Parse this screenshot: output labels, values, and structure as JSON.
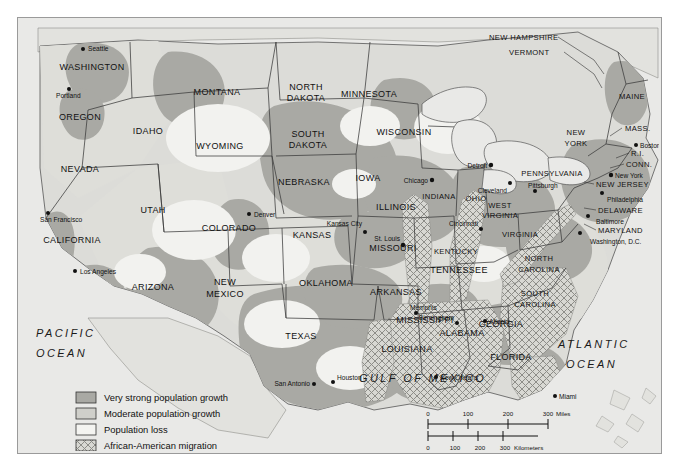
{
  "map": {
    "title": "United States population change and African-American migration",
    "background_color": "#e9e9e7",
    "land_color": "#dcdcd8",
    "frame_color": "#9a9a9a"
  },
  "oceans": [
    {
      "name": "pacific-ocean",
      "line1": "PACIFIC",
      "line2": "OCEAN"
    },
    {
      "name": "atlantic-ocean",
      "line1": "ATLANTIC",
      "line2": "OCEAN"
    },
    {
      "name": "gulf-of-mexico",
      "line1": "GULF OF MEXICO",
      "line2": ""
    }
  ],
  "states": [
    {
      "label": "WASHINGTON",
      "x": 91,
      "y": 69
    },
    {
      "label": "OREGON",
      "x": 79,
      "y": 119
    },
    {
      "label": "IDAHO",
      "x": 147,
      "y": 133
    },
    {
      "label": "MONTANA",
      "x": 216,
      "y": 94
    },
    {
      "label": "NORTH\nDAKOTA",
      "x": 305,
      "y": 93
    },
    {
      "label": "MINNESOTA",
      "x": 368,
      "y": 96
    },
    {
      "label": "WISCONSIN",
      "x": 403,
      "y": 134
    },
    {
      "label": "SOUTH\nDAKOTA",
      "x": 307,
      "y": 140
    },
    {
      "label": "WYOMING",
      "x": 219,
      "y": 148
    },
    {
      "label": "NEVADA",
      "x": 79,
      "y": 171
    },
    {
      "label": "NEBRASKA",
      "x": 303,
      "y": 184
    },
    {
      "label": "IOWA",
      "x": 367,
      "y": 180
    },
    {
      "label": "UTAH",
      "x": 152,
      "y": 212
    },
    {
      "label": "COLORADO",
      "x": 228,
      "y": 230
    },
    {
      "label": "KANSAS",
      "x": 311,
      "y": 237
    },
    {
      "label": "ILLINOIS",
      "x": 395,
      "y": 209
    },
    {
      "label": "INDIANA",
      "x": 438,
      "y": 198
    },
    {
      "label": "OHIO",
      "x": 475,
      "y": 200
    },
    {
      "label": "CALIFORNIA",
      "x": 71,
      "y": 242
    },
    {
      "label": "ARIZONA",
      "x": 152,
      "y": 289
    },
    {
      "label": "NEW\nMEXICO",
      "x": 224,
      "y": 290
    },
    {
      "label": "OKLAHOMA",
      "x": 325,
      "y": 285
    },
    {
      "label": "MISSOURI",
      "x": 392,
      "y": 250
    },
    {
      "label": "KENTUCKY",
      "x": 455,
      "y": 253
    },
    {
      "label": "WEST\nVIRGINIA",
      "x": 499,
      "y": 211
    },
    {
      "label": "VIRGINIA",
      "x": 519,
      "y": 236
    },
    {
      "label": "TENNESSEE",
      "x": 458,
      "y": 272
    },
    {
      "label": "NORTH\nCAROLINA",
      "x": 538,
      "y": 264
    },
    {
      "label": "SOUTH\nCAROLINA",
      "x": 534,
      "y": 299
    },
    {
      "label": "ARKANSAS",
      "x": 395,
      "y": 294
    },
    {
      "label": "MISSISSIPPI",
      "x": 424,
      "y": 322
    },
    {
      "label": "ALABAMA",
      "x": 461,
      "y": 335
    },
    {
      "label": "GEORGIA",
      "x": 500,
      "y": 326
    },
    {
      "label": "FLORIDA",
      "x": 510,
      "y": 359
    },
    {
      "label": "LOUISIANA",
      "x": 406,
      "y": 351
    },
    {
      "label": "TEXAS",
      "x": 300,
      "y": 338
    },
    {
      "label": "MAINE",
      "x": 631,
      "y": 98
    },
    {
      "label": "NEW\nYORK",
      "x": 575,
      "y": 139
    },
    {
      "label": "PENNSYLVANIA",
      "x": 551,
      "y": 175
    },
    {
      "label": "NEW HAMPSHIRE",
      "x": 545,
      "y": 39
    },
    {
      "label": "VERMONT",
      "x": 552,
      "y": 54
    },
    {
      "label": "MASS.",
      "x": 641,
      "y": 130
    },
    {
      "label": "R.I.",
      "x": 647,
      "y": 155
    },
    {
      "label": "CONN.",
      "x": 642,
      "y": 166
    },
    {
      "label": "NEW JERSEY",
      "x": 631,
      "y": 186
    },
    {
      "label": "DELAWARE",
      "x": 635,
      "y": 212
    },
    {
      "label": "MARYLAND",
      "x": 633,
      "y": 232
    }
  ],
  "cities": [
    {
      "label": "Seattle",
      "x": 77,
      "y": 46
    },
    {
      "label": "Portland",
      "x": 65,
      "y": 88
    },
    {
      "label": "San Francisco",
      "x": 42,
      "y": 219
    },
    {
      "label": "Los Angeles",
      "x": 68,
      "y": 270
    },
    {
      "label": "Denver",
      "x": 247,
      "y": 213
    },
    {
      "label": "Kansas City",
      "x": 360,
      "y": 224
    },
    {
      "label": "St. Louis",
      "x": 387,
      "y": 240
    },
    {
      "label": "Chicago",
      "x": 404,
      "y": 179
    },
    {
      "label": "Detroit",
      "x": 469,
      "y": 164
    },
    {
      "label": "Cleveland",
      "x": 487,
      "y": 187
    },
    {
      "label": "Cincinnati",
      "x": 476,
      "y": 225
    },
    {
      "label": "Pittsburgh",
      "x": 529,
      "y": 183
    },
    {
      "label": "Memphis",
      "x": 402,
      "y": 307
    },
    {
      "label": "Birmingham",
      "x": 435,
      "y": 315
    },
    {
      "label": "Atlanta",
      "x": 480,
      "y": 316
    },
    {
      "label": "New Orleans",
      "x": 433,
      "y": 373
    },
    {
      "label": "Houston",
      "x": 331,
      "y": 378
    },
    {
      "label": "San Antonio",
      "x": 277,
      "y": 381
    },
    {
      "label": "Miami",
      "x": 551,
      "y": 393
    },
    {
      "label": "Boston",
      "x": 636,
      "y": 143
    },
    {
      "label": "New York",
      "x": 618,
      "y": 175
    },
    {
      "label": "Philadelphia",
      "x": 630,
      "y": 200
    },
    {
      "label": "Baltimore",
      "x": 625,
      "y": 222
    },
    {
      "label": "Washington, D.C.",
      "x": 634,
      "y": 241
    }
  ],
  "legend": {
    "name": "map-legend",
    "items": [
      {
        "label": "Very strong population growth",
        "swatch": "very-strong-growth",
        "color": "#a9a9a4"
      },
      {
        "label": "Moderate population growth",
        "swatch": "moderate-growth",
        "color": "#cfcfca"
      },
      {
        "label": "Population loss",
        "swatch": "population-loss",
        "color": "#efefec"
      },
      {
        "label": "African-American migration",
        "swatch": "african-american-migration",
        "color": "hatch"
      }
    ]
  },
  "scale_bar": {
    "name": "scale-bar",
    "miles": {
      "ticks": [
        "0",
        "100",
        "200",
        "300"
      ],
      "unit": "Miles"
    },
    "kilometers": {
      "ticks": [
        "0",
        "100",
        "200",
        "300"
      ],
      "unit": "Kilometers"
    }
  }
}
